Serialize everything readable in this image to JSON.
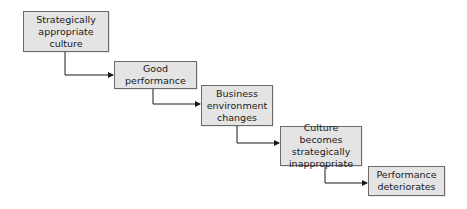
{
  "diagram": {
    "type": "flowchart-staircase",
    "colors": {
      "box_fill": "#e4e4e4",
      "box_border": "#6a6a6a",
      "line": "#1a1a1a",
      "text": "#1a1a1a"
    },
    "nodes": [
      {
        "id": "n1",
        "label": "Strategically\nappropriate\nculture"
      },
      {
        "id": "n2",
        "label": "Good\nperformance"
      },
      {
        "id": "n3",
        "label": "Business\nenvironment\nchanges"
      },
      {
        "id": "n4",
        "label": "Culture becomes\nstrategically\ninappropriate"
      },
      {
        "id": "n5",
        "label": "Performance\ndeteriorates"
      }
    ],
    "edges": [
      {
        "from": "n1",
        "to": "n2"
      },
      {
        "from": "n2",
        "to": "n3"
      },
      {
        "from": "n3",
        "to": "n4"
      },
      {
        "from": "n4",
        "to": "n5"
      }
    ]
  }
}
